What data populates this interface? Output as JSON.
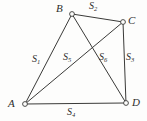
{
  "figure": {
    "type": "geometry-diagram",
    "background_color": "#fdfdfc",
    "stroke_color": "#3a3a38",
    "text_color": "#2e2e2c",
    "width": 147,
    "height": 121,
    "vertices": [
      {
        "id": "A",
        "label": "A",
        "x": 25,
        "y": 104
      },
      {
        "id": "B",
        "label": "B",
        "x": 72,
        "y": 14
      },
      {
        "id": "C",
        "label": "C",
        "x": 123,
        "y": 22
      },
      {
        "id": "D",
        "label": "D",
        "x": 126,
        "y": 103
      }
    ],
    "edges": [
      {
        "id": "AB",
        "from": "A",
        "to": "B",
        "kind": "side",
        "segment_label": "S1"
      },
      {
        "id": "BC",
        "from": "B",
        "to": "C",
        "kind": "side",
        "segment_label": "S2"
      },
      {
        "id": "CD",
        "from": "C",
        "to": "D",
        "kind": "side",
        "segment_label": "S3"
      },
      {
        "id": "AD",
        "from": "A",
        "to": "D",
        "kind": "side",
        "segment_label": "S4"
      },
      {
        "id": "AC",
        "from": "A",
        "to": "C",
        "kind": "diagonal",
        "segment_label": "S5"
      },
      {
        "id": "BD",
        "from": "B",
        "to": "D",
        "kind": "diagonal",
        "segment_label": "S6"
      }
    ],
    "intersection": {
      "x": 90,
      "y": 52
    },
    "segment_labels": {
      "S1": {
        "base": "S",
        "sub": "1"
      },
      "S2": {
        "base": "S",
        "sub": "2"
      },
      "S3": {
        "base": "S",
        "sub": "3"
      },
      "S4": {
        "base": "S",
        "sub": "4"
      },
      "S5": {
        "base": "S",
        "sub": "5"
      },
      "S6": {
        "base": "S",
        "sub": "6"
      }
    }
  }
}
